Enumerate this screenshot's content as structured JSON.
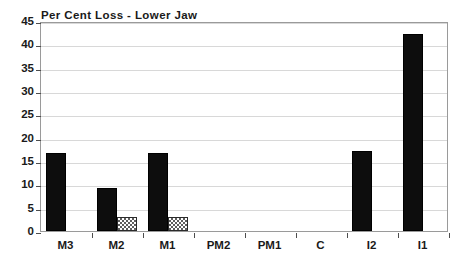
{
  "chart_data": {
    "type": "bar",
    "title": "Per Cent Loss - Lower Jaw",
    "xlabel": "",
    "ylabel": "",
    "ylim": [
      0,
      45
    ],
    "ytick_step": 5,
    "yticks": [
      0,
      5,
      10,
      15,
      20,
      25,
      30,
      35,
      40,
      45
    ],
    "grid": true,
    "grid_axis": "y",
    "legend": false,
    "legend_position": "none",
    "categories": [
      "M3",
      "M2",
      "M1",
      "PM2",
      "PM1",
      "C",
      "I2",
      "I1"
    ],
    "series": [
      {
        "name": "solid-black-series",
        "style": "solid-black",
        "color": "#0d0d0d",
        "values": [
          16.7,
          9.3,
          16.8,
          0,
          0,
          0,
          17.1,
          42.2
        ]
      },
      {
        "name": "checkered-gray-series",
        "style": "checkered-gray",
        "color": "#5f5f5f",
        "values": [
          0,
          3.0,
          3.0,
          0,
          0,
          0,
          0,
          0
        ]
      }
    ]
  },
  "axes": {
    "ytick_labels": [
      "0",
      "5",
      "10",
      "15",
      "20",
      "25",
      "30",
      "35",
      "40",
      "45"
    ],
    "xtick_labels": [
      "M3",
      "M2",
      "M1",
      "PM2",
      "PM1",
      "C",
      "I2",
      "I1"
    ]
  },
  "colors": {
    "frame": "#9a9a9a",
    "gridline": "#d8d8d8",
    "tick": "#4d4d4d",
    "text": "#1a1a1a",
    "background": "#ffffff",
    "series_solid": "#0d0d0d",
    "series_hatch": "#5f5f5f"
  }
}
